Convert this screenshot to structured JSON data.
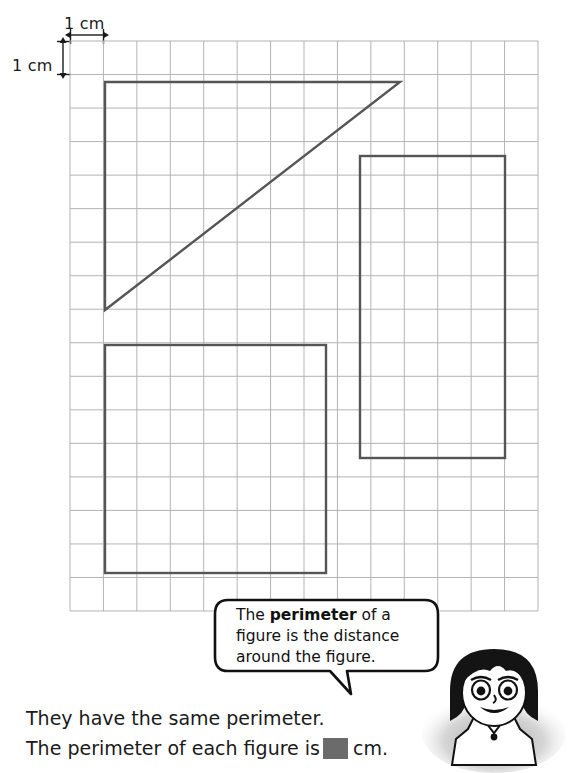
{
  "measurements": {
    "horizontal_label": "1 cm",
    "vertical_label": "1 cm"
  },
  "grid": {
    "columns": 14,
    "rows": 17,
    "cell_size_px": 33.5,
    "line_color": "#b3b3b3",
    "left": 70,
    "top": 41,
    "right": 538,
    "bottom": 611
  },
  "figures": {
    "stroke_color": "#555555",
    "stroke_width": 2.4,
    "items": [
      {
        "name": "triangle",
        "shape": "right-triangle",
        "points": "105,82 400,82 105,310",
        "base_cm": 9,
        "height_cm": 7
      },
      {
        "name": "right-rectangle",
        "shape": "rectangle",
        "x": 360,
        "y": 156,
        "width": 145,
        "height": 302,
        "width_cm": 4,
        "height_cm": 9
      },
      {
        "name": "bottom-left-square",
        "shape": "rectangle",
        "x": 105,
        "y": 345,
        "width": 221,
        "height": 228,
        "width_cm": 7,
        "height_cm": 7
      }
    ]
  },
  "speech_bubble": {
    "line1_before": "The ",
    "line1_bold": "perimeter",
    "line1_after": " of a",
    "line2": "figure is the distance",
    "line3": "around the figure."
  },
  "answer": {
    "line1": "They have the same perimeter.",
    "line2_before": "The perimeter of each figure is",
    "line2_after": "cm.",
    "blank_color": "#6b6b6b"
  },
  "character": {
    "description": "cartoon girl with dark bob hair"
  }
}
